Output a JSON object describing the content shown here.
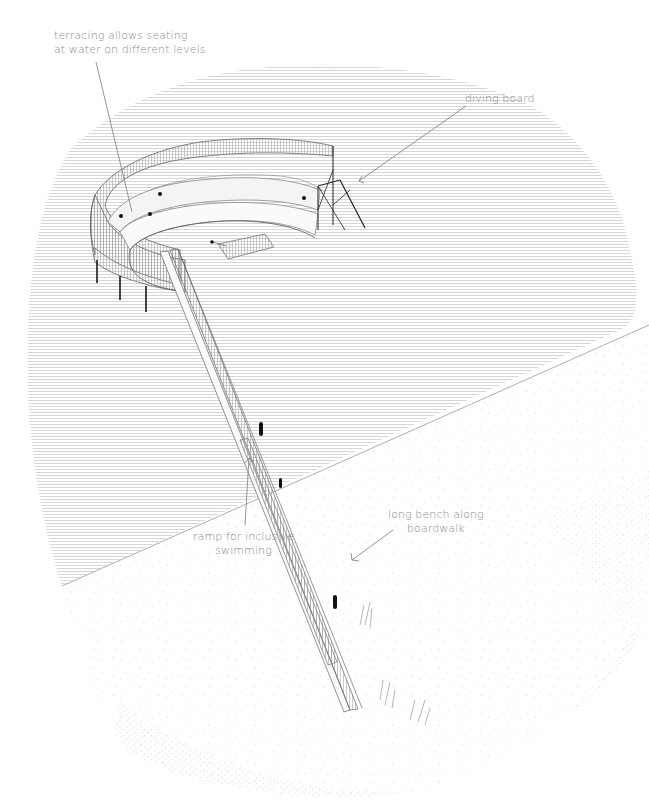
{
  "figure": {
    "type": "axonometric architectural drawing"
  },
  "annotations": [
    {
      "id": "terracing",
      "lines": [
        "terracing allows seating",
        "at water on different levels"
      ]
    },
    {
      "id": "diving-board",
      "lines": [
        "diving board"
      ]
    },
    {
      "id": "long-bench",
      "lines": [
        "long bench along",
        "boardwalk"
      ]
    },
    {
      "id": "ramp",
      "lines": [
        "ramp for inclusive",
        "swimming"
      ]
    }
  ],
  "colors": {
    "background": "#ffffff",
    "water_hatch": "#c8c8c8",
    "linework": "#555555",
    "label_text": "#8a8a8a",
    "leader_line": "#7a7a7a",
    "posts": "#1a1a1a",
    "sand_stipple": "#9a9a9a"
  }
}
